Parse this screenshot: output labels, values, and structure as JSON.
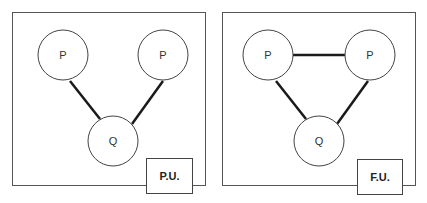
{
  "panels": [
    {
      "name": "left",
      "tag_label": "P.U.",
      "nodes": [
        {
          "id": "p1",
          "label": "P"
        },
        {
          "id": "p2",
          "label": "P"
        },
        {
          "id": "q",
          "label": "Q"
        }
      ],
      "edges": [
        [
          "p1",
          "q"
        ],
        [
          "p2",
          "q"
        ]
      ]
    },
    {
      "name": "right",
      "tag_label": "F.U.",
      "nodes": [
        {
          "id": "p1",
          "label": "P"
        },
        {
          "id": "p2",
          "label": "P"
        },
        {
          "id": "q",
          "label": "Q"
        }
      ],
      "edges": [
        [
          "p1",
          "p2"
        ],
        [
          "p1",
          "q"
        ],
        [
          "p2",
          "q"
        ]
      ]
    }
  ]
}
